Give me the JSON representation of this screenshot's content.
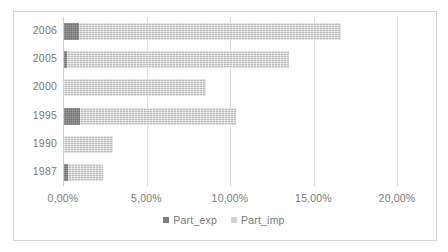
{
  "chart_data": {
    "type": "bar",
    "orientation": "horizontal",
    "stacked": true,
    "title": "",
    "subtitle": "",
    "xlabel": "",
    "ylabel": "",
    "categories": [
      "2006",
      "2005",
      "2000",
      "1995",
      "1990",
      "1987"
    ],
    "series": [
      {
        "name": "Part_exp",
        "color": "#7d7d7d",
        "values": [
          0.92,
          0.18,
          0.0,
          0.95,
          0.0,
          0.25
        ]
      },
      {
        "name": "Part_imp",
        "color": "#d2d2d2",
        "values": [
          15.68,
          13.32,
          8.5,
          9.35,
          2.93,
          2.09
        ]
      }
    ],
    "totals": [
      16.6,
      13.5,
      8.5,
      10.3,
      2.93,
      2.34
    ],
    "xlim": [
      0,
      20
    ],
    "xticks": [
      0,
      5,
      10,
      15,
      20
    ],
    "xtick_labels": [
      "0,00%",
      "5,00%",
      "10,00%",
      "15,00%",
      "20,00%"
    ],
    "grid": "vertical",
    "legend_position": "bottom",
    "value_suffix": "%"
  },
  "legend": {
    "items": [
      {
        "label": "Part_exp",
        "marker": "square-marker-dark"
      },
      {
        "label": "Part_imp",
        "marker": "square-marker-light"
      }
    ]
  },
  "colors": {
    "series_exp": "#7d7d7d",
    "series_imp": "#d2d2d2",
    "gridline": "#dcdcdc",
    "frame": "#d6d6d6",
    "text": "#7a7a7a",
    "background": "#ffffff"
  }
}
